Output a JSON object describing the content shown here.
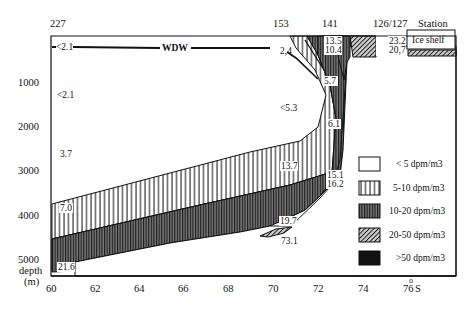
{
  "stations": {
    "s227": "227",
    "s153": "153",
    "s141": "141",
    "s126": "126/127",
    "station_label": "Station"
  },
  "x_axis": {
    "ticks": [
      "60",
      "62",
      "64",
      "66",
      "68",
      "70",
      "72",
      "74",
      "76"
    ],
    "unit": "S",
    "unit_sup": "o"
  },
  "y_axis": {
    "ticks": [
      "1000",
      "2000",
      "3000",
      "4000",
      "5000"
    ],
    "label_line1": "depth",
    "label_line2": "(m)"
  },
  "annotations": {
    "wdw": "WDW",
    "ice_shelf": "Ice shelf",
    "v_lt21_top": "<2.1",
    "v_lt21": "<2.1",
    "v_37": "3.7",
    "v_70": "7.0",
    "v_216": "21.6",
    "v_24": "2,4",
    "v_lt53": "<5.3",
    "v_135": "13.5",
    "v_104": "10.4",
    "v_57": "5.7",
    "v_61": "6.1",
    "v_137": "13.7",
    "v_151": "15.1",
    "v_162": "16.2",
    "v_197": "19.7",
    "v_731": "73.1",
    "v_232": "23.2",
    "v_207": "20,7"
  },
  "legend": [
    {
      "pattern": "white",
      "label": "< 5 dpm/m3"
    },
    {
      "pattern": "vertical-sparse",
      "label": "5-10 dpm/m3"
    },
    {
      "pattern": "vertical-dense",
      "label": "10-20 dpm/m3"
    },
    {
      "pattern": "diagonal",
      "label": "20-50 dpm/m3"
    },
    {
      "pattern": "solid",
      "label": ">50 dpm/m3"
    }
  ]
}
